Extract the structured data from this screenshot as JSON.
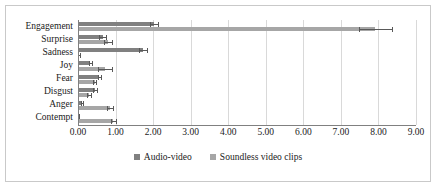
{
  "chart_data": {
    "type": "bar",
    "orientation": "horizontal",
    "title": "",
    "xlabel": "",
    "ylabel": "",
    "xlim": [
      0,
      9
    ],
    "xticks": [
      "0.00",
      "1.00",
      "2.00",
      "3.00",
      "4.00",
      "5.00",
      "6.00",
      "7.00",
      "8.00",
      "9.00"
    ],
    "xtick_values": [
      0,
      1,
      2,
      3,
      4,
      5,
      6,
      7,
      8,
      9
    ],
    "grid": "vertical",
    "legend_position": "bottom",
    "categories": [
      "Engagement",
      "Surprise",
      "Sadness",
      "Joy",
      "Fear",
      "Disgust",
      "Anger",
      "Contempt"
    ],
    "series": [
      {
        "name": "Audio-video",
        "color": "#808080",
        "values": [
          2.02,
          0.66,
          1.74,
          0.33,
          0.57,
          0.45,
          0.1,
          0.02
        ],
        "errors": [
          0.1,
          0.09,
          0.11,
          0.04,
          0.05,
          0.05,
          0.03,
          0.01
        ],
        "error_upper": [
          2.12,
          0.75,
          1.85,
          0.37,
          0.62,
          0.5,
          0.13,
          0.03
        ]
      },
      {
        "name": "Soundless video clips",
        "color": "#a6a6a6",
        "values": [
          7.92,
          0.79,
          0.03,
          0.72,
          0.44,
          0.3,
          0.84,
          0.94
        ],
        "errors": [
          0.43,
          0.11,
          0.02,
          0.19,
          0.05,
          0.05,
          0.08,
          0.07
        ],
        "error_upper": [
          8.35,
          0.9,
          0.05,
          0.91,
          0.49,
          0.35,
          0.92,
          1.01
        ]
      }
    ]
  },
  "legend": {
    "items": [
      {
        "label": "Audio-video",
        "color": "#808080"
      },
      {
        "label": "Soundless video clips",
        "color": "#a6a6a6"
      }
    ]
  }
}
